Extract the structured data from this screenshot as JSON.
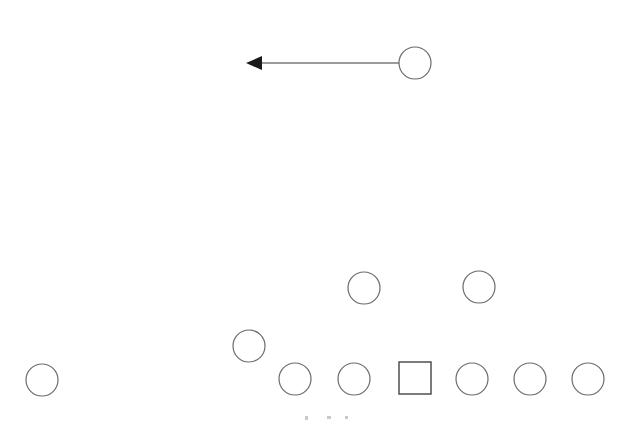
{
  "diagram": {
    "background_color": "#ffffff",
    "width": 639,
    "height": 421,
    "stroke_color": "#6b6b6b",
    "square_stroke_color": "#5a5a5a",
    "edge_color": "#7a7a7a",
    "arrowhead_color": "#1a1a1a",
    "tick_color": "#c9c9c9"
  },
  "nodes": [
    {
      "id": "n1",
      "shape": "circle",
      "cx": 415,
      "cy": 63,
      "r": 16,
      "label": ""
    },
    {
      "id": "n2",
      "shape": "circle",
      "cx": 364,
      "cy": 288,
      "r": 16,
      "label": ""
    },
    {
      "id": "n3",
      "shape": "circle",
      "cx": 479,
      "cy": 287,
      "r": 16,
      "label": ""
    },
    {
      "id": "n4",
      "shape": "circle",
      "cx": 249,
      "cy": 346,
      "r": 16,
      "label": ""
    },
    {
      "id": "n5",
      "shape": "circle",
      "cx": 42,
      "cy": 380,
      "r": 16,
      "label": ""
    },
    {
      "id": "n6",
      "shape": "circle",
      "cx": 295,
      "cy": 379,
      "r": 16,
      "label": ""
    },
    {
      "id": "n7",
      "shape": "circle",
      "cx": 354,
      "cy": 379,
      "r": 16,
      "label": ""
    },
    {
      "id": "n8",
      "shape": "square",
      "cx": 415,
      "cy": 378,
      "size": 32,
      "label": ""
    },
    {
      "id": "n9",
      "shape": "circle",
      "cx": 472,
      "cy": 379,
      "r": 16,
      "label": ""
    },
    {
      "id": "n10",
      "shape": "circle",
      "cx": 530,
      "cy": 379,
      "r": 16,
      "label": ""
    },
    {
      "id": "n11",
      "shape": "circle",
      "cx": 588,
      "cy": 379,
      "r": 16,
      "label": ""
    }
  ],
  "edges": [
    {
      "id": "e1",
      "from": "n1",
      "to": "arrow-tip",
      "x1": 399,
      "y1": 63,
      "x2": 259,
      "y2": 63,
      "direction": "left",
      "arrowhead": true,
      "head_points": "246,63 262,56 262,70"
    }
  ],
  "tick_marks": [
    {
      "x": 305,
      "y": 416,
      "w": 3,
      "h": 4
    },
    {
      "x": 327,
      "y": 416,
      "w": 4,
      "h": 3
    },
    {
      "x": 345,
      "y": 416,
      "w": 3,
      "h": 3
    }
  ]
}
